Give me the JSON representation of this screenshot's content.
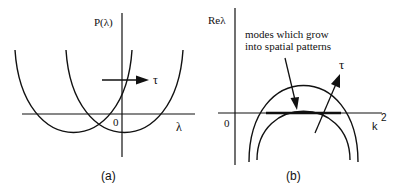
{
  "panels": [
    {
      "id": "a",
      "caption": "(a)",
      "y_label": "P(λ)",
      "x_label": "λ",
      "origin_label": "0",
      "arrow_label": "τ",
      "description": "Two parabolas P(λ); shifting in direction τ"
    },
    {
      "id": "b",
      "caption": "(b)",
      "y_label": "Reλ",
      "x_label": "k",
      "x_label_sup": "2",
      "origin_label": "0",
      "arrow_label": "τ",
      "annotation_line1": "modes which grow",
      "annotation_line2": "into spatial patterns",
      "description": "Dispersion relation Reλ vs k², two arches; outer arch crosses zero"
    }
  ],
  "colors": {
    "ink": "#111111",
    "background": "#ffffff"
  }
}
